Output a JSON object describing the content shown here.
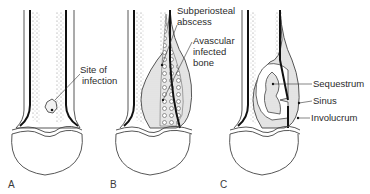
{
  "figure": {
    "panels": [
      {
        "letter": "A",
        "labels": [
          "Site of",
          "infection"
        ]
      },
      {
        "letter": "B",
        "labels": [
          "Subperiosteal",
          "abscess",
          "Avascular",
          "infected",
          "bone"
        ]
      },
      {
        "letter": "C",
        "labels": [
          "Sequestrum",
          "Sinus",
          "Involucrum"
        ]
      }
    ]
  }
}
